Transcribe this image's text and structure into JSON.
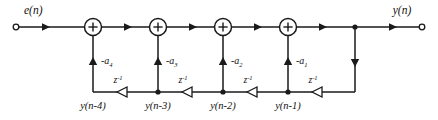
{
  "diagram": {
    "input": {
      "label": "e(n)",
      "terminal": "input-terminal"
    },
    "output": {
      "label": "y(n)",
      "terminal": "output-terminal"
    },
    "adders": [
      {
        "id": "adder-1",
        "symbol": "+"
      },
      {
        "id": "adder-2",
        "symbol": "+"
      },
      {
        "id": "adder-3",
        "symbol": "+"
      },
      {
        "id": "adder-4",
        "symbol": "+"
      }
    ],
    "coefficients": [
      {
        "id": "coef-a4",
        "base": "-a",
        "subscript": "4"
      },
      {
        "id": "coef-a3",
        "base": "-a",
        "subscript": "3"
      },
      {
        "id": "coef-a2",
        "base": "-a",
        "subscript": "2"
      },
      {
        "id": "coef-a1",
        "base": "-a",
        "subscript": "1"
      }
    ],
    "delays": [
      {
        "id": "delay-1",
        "base": "z",
        "superscript": "-1"
      },
      {
        "id": "delay-2",
        "base": "z",
        "superscript": "-1"
      },
      {
        "id": "delay-3",
        "base": "z",
        "superscript": "-1"
      },
      {
        "id": "delay-4",
        "base": "z",
        "superscript": "-1"
      }
    ],
    "state_nodes": [
      {
        "id": "node-yn4",
        "label": "y(n-4)"
      },
      {
        "id": "node-yn3",
        "label": "y(n-3)"
      },
      {
        "id": "node-yn2",
        "label": "y(n-2)"
      },
      {
        "id": "node-yn1",
        "label": "y(n-1)"
      }
    ],
    "colors": {
      "line": "#1a1a1a",
      "background": "#ffffff",
      "text": "#111111"
    }
  }
}
